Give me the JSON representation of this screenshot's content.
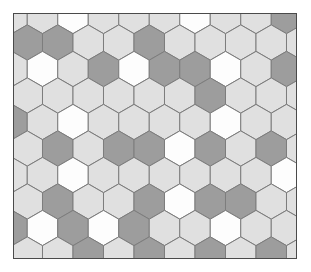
{
  "figure": {
    "frame": {
      "border_color": "#4a4a4a",
      "background_color": "#e8e8e8",
      "x": 13,
      "y": 13,
      "width": 284,
      "height": 246
    },
    "page_background": "#ffffff"
  },
  "palette": {
    "white": "#fdfdfd",
    "light": "#e0e0e0",
    "medium": "#9d9d9d",
    "stroke": "#7d7d7d"
  },
  "chart_data": {
    "type": "heatmap",
    "xlabel": "",
    "ylabel": "",
    "grid": "hexagonal-pointy-top",
    "legend": "none",
    "geometry": {
      "orientation": "pointy-top",
      "column_pitch": 30.5,
      "row_pitch": 26.5,
      "hex_radius": 17.6,
      "columns": 10,
      "rows": 10
    },
    "categories": [
      "white",
      "light",
      "medium"
    ],
    "values": [
      0,
      1,
      2
    ],
    "rows_of_cells": [
      [
        1,
        1,
        0,
        1,
        1,
        1,
        0,
        1,
        1,
        2
      ],
      [
        2,
        2,
        1,
        1,
        2,
        1,
        1,
        1,
        1,
        1
      ],
      [
        1,
        0,
        1,
        2,
        0,
        2,
        2,
        0,
        1,
        2
      ],
      [
        1,
        1,
        1,
        1,
        1,
        1,
        2,
        1,
        1,
        1
      ],
      [
        2,
        1,
        0,
        1,
        1,
        1,
        1,
        0,
        1,
        1
      ],
      [
        1,
        2,
        1,
        2,
        2,
        0,
        2,
        1,
        2,
        1
      ],
      [
        1,
        1,
        0,
        1,
        1,
        1,
        1,
        1,
        1,
        0
      ],
      [
        1,
        2,
        1,
        1,
        2,
        0,
        2,
        2,
        1,
        1
      ],
      [
        2,
        0,
        2,
        0,
        2,
        1,
        1,
        0,
        1,
        1
      ],
      [
        1,
        1,
        2,
        1,
        2,
        1,
        2,
        1,
        2,
        1
      ]
    ]
  }
}
